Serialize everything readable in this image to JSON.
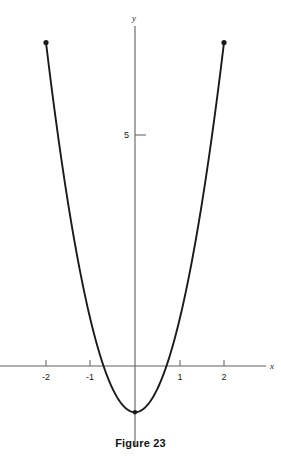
{
  "header": {
    "running_title": "Functions"
  },
  "caption": {
    "text": "Figure 23"
  },
  "chart_data": {
    "type": "line",
    "title": "",
    "subtitle": "",
    "xlabel": "x",
    "ylabel": "y",
    "xlim": [
      -2.55,
      3.05
    ],
    "ylim": [
      -2.0,
      8.05
    ],
    "grid": false,
    "legend": null,
    "x_ticks": [
      -2,
      -1,
      1,
      2
    ],
    "x_tick_labels": [
      "-2",
      "-1",
      "1",
      "2"
    ],
    "y_ticks": [
      5
    ],
    "y_tick_labels": [
      "5"
    ],
    "curve_label": "",
    "curve_color": "#1a1a1a",
    "axis_color": "#606060",
    "series": [
      {
        "name": "parabola",
        "equation": "y = 2x^2 - 1",
        "domain": [
          -2,
          2
        ],
        "x": [
          -2.0,
          -1.8,
          -1.6,
          -1.4,
          -1.2,
          -1.0,
          -0.8,
          -0.6,
          -0.4,
          -0.2,
          0.0,
          0.2,
          0.4,
          0.6,
          0.8,
          1.0,
          1.2,
          1.4,
          1.6,
          1.8,
          2.0
        ],
        "values": [
          7.0,
          5.48,
          4.12,
          2.92,
          1.88,
          1.0,
          0.28,
          -0.28,
          -0.68,
          -0.92,
          -1.0,
          -0.92,
          -0.68,
          -0.28,
          0.28,
          1.0,
          1.88,
          2.92,
          4.12,
          5.48,
          7.0
        ]
      }
    ],
    "endpoints": [
      {
        "name": "left-endpoint",
        "x": -2,
        "y": 7.0,
        "filled": true
      },
      {
        "name": "right-endpoint",
        "x": 2,
        "y": 7.0,
        "filled": true
      }
    ],
    "vertex": {
      "name": "vertex",
      "x": 0,
      "y": -1.0,
      "marked": true
    },
    "annotations": []
  }
}
